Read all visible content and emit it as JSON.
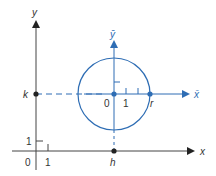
{
  "diagram": {
    "colors": {
      "original_axes": "#333333",
      "translated_axes": "#2e6db4",
      "circle": "#2e6db4",
      "points": "#222222"
    },
    "original_axes": {
      "x_label": "x",
      "y_label": "y",
      "origin_label": "0",
      "x_unit_label": "1",
      "y_unit_label": "1"
    },
    "translated_axes": {
      "x_label": "x̄",
      "y_label": "ȳ",
      "origin_label": "0",
      "x_unit_label": "1",
      "radius_label": "r"
    },
    "points": {
      "h_label": "h",
      "k_label": "k"
    }
  }
}
